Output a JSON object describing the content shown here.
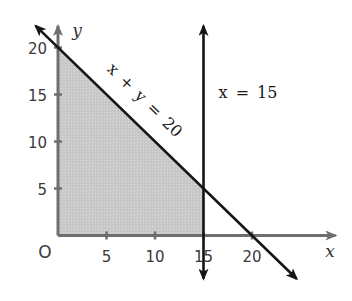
{
  "chart_data": {
    "type": "line",
    "title": "",
    "xlabel": "x",
    "ylabel": "y",
    "origin_label": "O",
    "xlim": [
      0,
      28.6
    ],
    "ylim": [
      0,
      22.3
    ],
    "grid": false,
    "x_ticks": [
      5,
      10,
      15,
      20
    ],
    "x_tick_labels": [
      "5",
      "10",
      "15",
      "20"
    ],
    "y_ticks": [
      5,
      10,
      15,
      20
    ],
    "y_tick_labels": [
      "5",
      "10",
      "15",
      "20"
    ],
    "axis_color": "#6e6e6e",
    "series": [
      {
        "name": "x + y = 20",
        "label": "x + y = 20",
        "equation": "x + y = 20",
        "points": [
          [
            -2.3,
            22.3
          ],
          [
            24.6,
            -4.6
          ]
        ],
        "arrows": "both",
        "color": "#151515"
      },
      {
        "name": "x = 15",
        "label": "x = 15",
        "equation": "x = 15",
        "points": [
          [
            15,
            22.3
          ],
          [
            15,
            -4.6
          ]
        ],
        "arrows": "both",
        "color": "#151515"
      }
    ],
    "shaded_region": {
      "description": "feasible region x >= 0, y >= 0, x + y <= 20, x <= 15",
      "vertices": [
        [
          0,
          0
        ],
        [
          0,
          20
        ],
        [
          15,
          5
        ],
        [
          15,
          0
        ]
      ],
      "color": "#cacaca"
    }
  }
}
